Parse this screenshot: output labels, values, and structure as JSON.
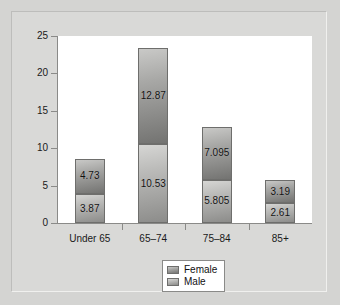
{
  "chart_data": {
    "type": "bar",
    "subtype": "stacked-vertical",
    "title": "",
    "xlabel": "",
    "ylabel": "",
    "ylim": [
      0,
      25
    ],
    "yticks": [
      0,
      5,
      10,
      15,
      20,
      25
    ],
    "ytick_labels": [
      "0",
      "5",
      "10",
      "15",
      "20",
      "25"
    ],
    "grid": false,
    "categories": [
      "Under 65",
      "65–74",
      "75–84",
      "85+"
    ],
    "series": [
      {
        "name": "Male",
        "stack_position": "bottom",
        "color": "#bcbcba",
        "values": [
          3.87,
          10.53,
          5.805,
          2.61
        ],
        "labels": [
          "3.87",
          "10.53",
          "5.805",
          "2.61"
        ]
      },
      {
        "name": "Female",
        "stack_position": "top",
        "color": "#a8a8a6",
        "values": [
          4.73,
          12.87,
          7.095,
          3.19
        ],
        "labels": [
          "4.73",
          "12.87",
          "7.095",
          "3.19"
        ]
      }
    ],
    "totals": [
      8.6,
      23.4,
      12.9,
      5.8
    ],
    "legend": {
      "position": "bottom-center",
      "entries": [
        "Female",
        "Male"
      ]
    }
  },
  "colors": {
    "figure_background": "#d4d4d2",
    "plot_background": "#ffffff",
    "axis": "#8a8a88",
    "text": "#111111",
    "female": "#a8a8a6",
    "male": "#bcbcba"
  }
}
